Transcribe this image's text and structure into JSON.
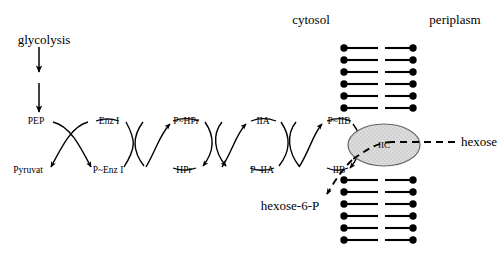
{
  "diagram": {
    "compartments": {
      "cytosol": "cytosol",
      "periplasm": "periplasm"
    },
    "source": {
      "label": "glycolysis"
    },
    "cycles": [
      {
        "id": "enzyme-i",
        "top_left": "PEP",
        "bottom_left": "Pyruvat",
        "top_right": "Enz I",
        "bottom_right": "P~Enz I"
      },
      {
        "id": "hpr",
        "top_left": "P~HPr",
        "bottom_left": "HPr",
        "top_right": "IIA",
        "bottom_right": "P~IIA"
      },
      {
        "id": "iib",
        "top_left": "P~IIB",
        "bottom_left": "IIB"
      }
    ],
    "nodes": {
      "pep": "PEP",
      "pyruvate": "Pyruvat",
      "enz_i": "Enz I",
      "p_enz_i": "P~Enz I",
      "p_hpr": "P~HPr",
      "hpr": "HPr",
      "iia": "IIA",
      "p_iia": "P~IIA",
      "p_iib": "P~IIB",
      "iib": "IIB"
    },
    "transporter": {
      "label": "IIC",
      "fill_color": "#d9d9d9",
      "stroke_color": "#555555"
    },
    "substrate": {
      "label": "hexose"
    },
    "product": {
      "label": "hexose-6-P"
    },
    "membrane": {
      "lipid_color": "#000000",
      "upper_leaflet_rows": 6,
      "lower_leaflet_rows": 6
    },
    "colors": {
      "ink": "#000000",
      "background": "#ffffff"
    }
  }
}
